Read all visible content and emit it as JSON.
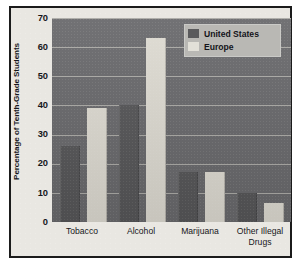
{
  "chart_data": {
    "type": "bar",
    "title": "",
    "subtitle": "",
    "xlabel": "",
    "ylabel": "Percentage of Tenth-Grade Students",
    "ylim": [
      0,
      70
    ],
    "yticks": [
      0,
      10,
      20,
      30,
      40,
      50,
      60,
      70
    ],
    "grid": true,
    "legend_position": "top-right",
    "categories": [
      "Tobacco",
      "Alcohol",
      "Marijuana",
      "Other Illegal Drugs"
    ],
    "series": [
      {
        "name": "United States",
        "color": "#575759",
        "values": [
          26,
          40,
          17,
          10
        ]
      },
      {
        "name": "Europe",
        "color": "#dedbd2",
        "values": [
          39,
          63,
          17,
          6.5
        ]
      }
    ]
  },
  "axis": {
    "y_title": "Percentage of Tenth-Grade Students",
    "y_tick_labels": [
      "70",
      "60",
      "50",
      "40",
      "30",
      "20",
      "10",
      "0"
    ],
    "x_tick_labels": [
      {
        "line1": "Tobacco",
        "line2": ""
      },
      {
        "line1": "Alcohol",
        "line2": ""
      },
      {
        "line1": "Marijuana",
        "line2": ""
      },
      {
        "line1": "Other Illegal",
        "line2": "Drugs"
      }
    ]
  },
  "legend": {
    "items": [
      {
        "label": "United States",
        "swatch": "#575759"
      },
      {
        "label": "Europe",
        "swatch": "#dedbd2"
      }
    ]
  },
  "colors": {
    "page_background": "#e9e7e2",
    "frame": "#1b1b1b",
    "plot_background": "#6a6a6d",
    "gridline": "#b7b6b2",
    "us_bar": "#575759",
    "europe_bar": "#dedbd2",
    "legend_background": "#b9b8b4",
    "text": "#17171b"
  }
}
